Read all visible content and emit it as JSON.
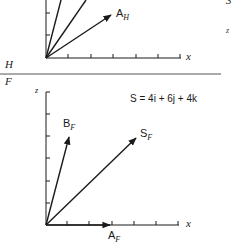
{
  "top_panel": {
    "label": "H",
    "vector_label": "A",
    "vector_sub": "H",
    "x_axis_label": "x",
    "right_edge_number": "3",
    "right_edge_axis": "z"
  },
  "bottom_panel": {
    "label": "F",
    "z_axis_label": "z",
    "x_axis_label": "x",
    "equation": "S = 4i + 6j + 4k",
    "vectors": [
      {
        "name": "A",
        "sub": "F"
      },
      {
        "name": "B",
        "sub": "F"
      },
      {
        "name": "S",
        "sub": "F"
      }
    ]
  },
  "colors": {
    "ink": "#1a1a1a",
    "separator": "#555555"
  }
}
